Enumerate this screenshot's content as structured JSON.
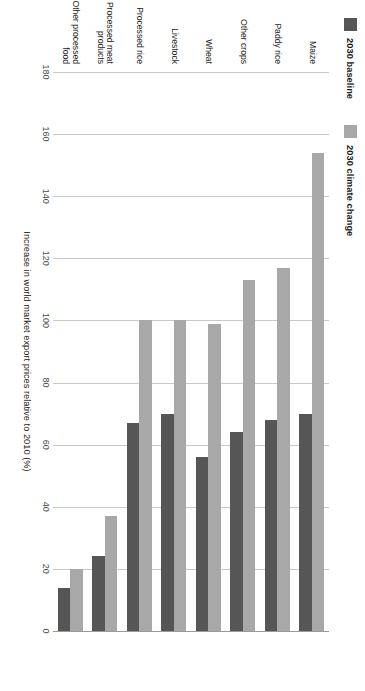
{
  "chart_data": {
    "type": "bar",
    "orientation": "horizontal",
    "title": "",
    "subtitle": "",
    "xlabel": "Increase in world market export prices relative to 2010 (%)",
    "ylabel": "",
    "xlim": [
      0,
      180
    ],
    "xticks": [
      0,
      20,
      40,
      60,
      80,
      100,
      120,
      140,
      160,
      180
    ],
    "xtick_labels": [
      "0",
      "20",
      "40",
      "60",
      "80",
      "100",
      "120",
      "140",
      "160",
      "180"
    ],
    "grid": true,
    "legend_position": "top-left",
    "categories": [
      "Maize",
      "Paddy rice",
      "Other crops",
      "Wheat",
      "Livestock",
      "Processed rice",
      "Processed meat products",
      "Other processed food"
    ],
    "series": [
      {
        "name": "2030 baseline",
        "color": "#565656",
        "values": [
          70,
          68,
          64,
          56,
          70,
          67,
          24,
          14
        ]
      },
      {
        "name": "2030 climate change",
        "color": "#a8a8a8",
        "values": [
          154,
          117,
          113,
          99,
          100,
          100,
          37,
          20
        ]
      }
    ]
  },
  "legend": {
    "items": [
      {
        "label": "2030 baseline",
        "color": "#565656"
      },
      {
        "label": "2030 climate change",
        "color": "#a8a8a8"
      }
    ]
  },
  "axis": {
    "x_title": "Increase in world market export prices relative to 2010 (%)",
    "tick_labels": [
      "0",
      "20",
      "40",
      "60",
      "80",
      "100",
      "120",
      "140",
      "160",
      "180"
    ]
  },
  "categories": [
    {
      "label": "Maize"
    },
    {
      "label": "Paddy rice"
    },
    {
      "label": "Other crops"
    },
    {
      "label": "Wheat"
    },
    {
      "label": "Livestock"
    },
    {
      "label": "Processed rice"
    },
    {
      "label": "Processed meat products"
    },
    {
      "label": "Other processed food"
    }
  ],
  "colors": {
    "baseline": "#565656",
    "climate_change": "#a8a8a8",
    "gridline": "#c9c9c9",
    "background": "#ffffff"
  }
}
